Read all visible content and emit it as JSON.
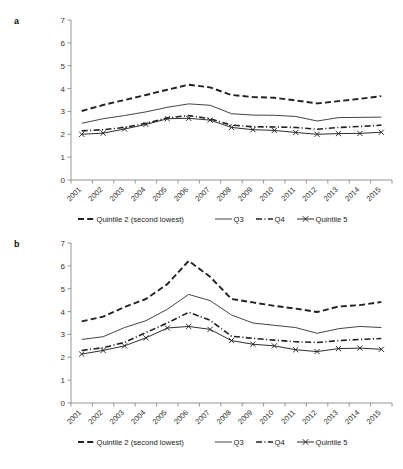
{
  "figure": {
    "panels": [
      {
        "label": "a",
        "name": "panel-a"
      },
      {
        "label": "b",
        "name": "panel-b"
      }
    ]
  },
  "legend": {
    "position": "bottom",
    "items": [
      {
        "label": "Quintile 2 (second lowest)",
        "style": "dashed"
      },
      {
        "label": "Q3",
        "style": "solid-thin"
      },
      {
        "label": "Q4",
        "style": "dash-dot"
      },
      {
        "label": "Quintile 5",
        "style": "solid-x-marker"
      }
    ]
  },
  "axis": {
    "ylim": [
      0,
      7
    ],
    "yticks": [
      "0",
      "1",
      "2",
      "3",
      "4",
      "5",
      "6",
      "7"
    ],
    "xticks": [
      "2001",
      "2002",
      "2003",
      "2004",
      "2005",
      "2006",
      "2007",
      "2008",
      "2009",
      "2010",
      "2011",
      "2012",
      "2013",
      "2014",
      "2015"
    ],
    "grid": "none",
    "xlabel": "",
    "ylabel": ""
  },
  "chart_data": [
    {
      "type": "line",
      "panel": "a",
      "title": "",
      "xlabel": "",
      "ylabel": "",
      "ylim": [
        0,
        7
      ],
      "grid": false,
      "legend_position": "bottom",
      "categories": [
        "2001",
        "2002",
        "2003",
        "2004",
        "2005",
        "2006",
        "2007",
        "2008",
        "2009",
        "2010",
        "2011",
        "2012",
        "2013",
        "2014",
        "2015"
      ],
      "series": [
        {
          "name": "Quintile 2 (second lowest)",
          "values": [
            3.02,
            3.28,
            3.5,
            3.72,
            3.95,
            4.17,
            4.05,
            3.72,
            3.63,
            3.6,
            3.48,
            3.35,
            3.45,
            3.55,
            3.67
          ]
        },
        {
          "name": "Q3",
          "values": [
            2.48,
            2.68,
            2.82,
            2.98,
            3.18,
            3.33,
            3.27,
            2.9,
            2.84,
            2.83,
            2.78,
            2.58,
            2.73,
            2.74,
            2.75
          ]
        },
        {
          "name": "Q4",
          "values": [
            2.15,
            2.2,
            2.3,
            2.48,
            2.72,
            2.82,
            2.68,
            2.4,
            2.33,
            2.32,
            2.3,
            2.22,
            2.3,
            2.34,
            2.4
          ]
        },
        {
          "name": "Quintile 5",
          "values": [
            2.0,
            2.05,
            2.23,
            2.43,
            2.68,
            2.7,
            2.62,
            2.3,
            2.2,
            2.17,
            2.08,
            2.0,
            2.03,
            2.04,
            2.09
          ]
        }
      ]
    },
    {
      "type": "line",
      "panel": "b",
      "title": "",
      "xlabel": "",
      "ylabel": "",
      "ylim": [
        0,
        7
      ],
      "grid": false,
      "legend_position": "bottom",
      "categories": [
        "2001",
        "2002",
        "2003",
        "2004",
        "2005",
        "2006",
        "2007",
        "2008",
        "2009",
        "2010",
        "2011",
        "2012",
        "2013",
        "2014",
        "2015"
      ],
      "series": [
        {
          "name": "Quintile 2 (second lowest)",
          "values": [
            3.57,
            3.78,
            4.2,
            4.55,
            5.2,
            6.22,
            5.52,
            4.55,
            4.4,
            4.25,
            4.13,
            3.98,
            4.22,
            4.28,
            4.42
          ]
        },
        {
          "name": "Q3",
          "values": [
            2.78,
            2.9,
            3.3,
            3.6,
            4.1,
            4.75,
            4.48,
            3.85,
            3.5,
            3.4,
            3.3,
            3.05,
            3.25,
            3.35,
            3.3
          ]
        },
        {
          "name": "Q4",
          "values": [
            2.3,
            2.42,
            2.65,
            3.08,
            3.5,
            3.97,
            3.62,
            2.92,
            2.83,
            2.75,
            2.68,
            2.65,
            2.73,
            2.78,
            2.82
          ]
        },
        {
          "name": "Quintile 5",
          "values": [
            2.14,
            2.3,
            2.5,
            2.85,
            3.28,
            3.35,
            3.22,
            2.73,
            2.57,
            2.5,
            2.33,
            2.25,
            2.38,
            2.4,
            2.35
          ]
        }
      ]
    }
  ]
}
